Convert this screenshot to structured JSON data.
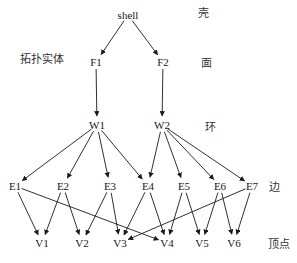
{
  "diagram": {
    "type": "topology-hierarchy",
    "levels": [
      {
        "name": "shell",
        "label": "壳",
        "nodes": [
          {
            "id": "shell",
            "text": "shell",
            "x": 128,
            "y": 15
          }
        ]
      },
      {
        "name": "face",
        "label": "面",
        "nodes": [
          {
            "id": "F1",
            "text": "F1",
            "x": 96,
            "y": 62
          },
          {
            "id": "F2",
            "text": "F2",
            "x": 163,
            "y": 62
          }
        ]
      },
      {
        "name": "loop",
        "label": "环",
        "nodes": [
          {
            "id": "W1",
            "text": "W1",
            "x": 97,
            "y": 125
          },
          {
            "id": "W2",
            "text": "W2",
            "x": 162,
            "y": 125
          }
        ]
      },
      {
        "name": "edge",
        "label": "边",
        "nodes": [
          {
            "id": "E1",
            "text": "E1",
            "x": 15,
            "y": 186
          },
          {
            "id": "E2",
            "text": "E2",
            "x": 63,
            "y": 186
          },
          {
            "id": "E3",
            "text": "E3",
            "x": 110,
            "y": 186
          },
          {
            "id": "E4",
            "text": "E4",
            "x": 148,
            "y": 186
          },
          {
            "id": "E5",
            "text": "E5",
            "x": 184,
            "y": 186
          },
          {
            "id": "E6",
            "text": "E6",
            "x": 220,
            "y": 186
          },
          {
            "id": "E7",
            "text": "E7",
            "x": 252,
            "y": 186
          }
        ]
      },
      {
        "name": "vertex",
        "label": "顶点",
        "nodes": [
          {
            "id": "V1",
            "text": "V1",
            "x": 42,
            "y": 243
          },
          {
            "id": "V2",
            "text": "V2",
            "x": 82,
            "y": 243
          },
          {
            "id": "V3",
            "text": "V3",
            "x": 120,
            "y": 243
          },
          {
            "id": "V4",
            "text": "V4",
            "x": 167,
            "y": 243
          },
          {
            "id": "V5",
            "text": "V5",
            "x": 202,
            "y": 243
          },
          {
            "id": "V6",
            "text": "V6",
            "x": 234,
            "y": 243
          }
        ]
      }
    ],
    "side_labels": {
      "topo_entity": "拓扑实体",
      "shell": "壳",
      "face": "面",
      "loop": "环",
      "edge": "边",
      "vertex": "顶点"
    },
    "edges": [
      [
        "shell",
        "F1"
      ],
      [
        "shell",
        "F2"
      ],
      [
        "F1",
        "W1"
      ],
      [
        "F2",
        "W2"
      ],
      [
        "W1",
        "E1"
      ],
      [
        "W1",
        "E2"
      ],
      [
        "W1",
        "E3"
      ],
      [
        "W1",
        "E4"
      ],
      [
        "W2",
        "E4"
      ],
      [
        "W2",
        "E5"
      ],
      [
        "W2",
        "E6"
      ],
      [
        "W2",
        "E7"
      ],
      [
        "E1",
        "V1"
      ],
      [
        "E1",
        "V4"
      ],
      [
        "E2",
        "V1"
      ],
      [
        "E2",
        "V2"
      ],
      [
        "E3",
        "V2"
      ],
      [
        "E3",
        "V3"
      ],
      [
        "E4",
        "V3"
      ],
      [
        "E4",
        "V4"
      ],
      [
        "E5",
        "V4"
      ],
      [
        "E5",
        "V5"
      ],
      [
        "E6",
        "V5"
      ],
      [
        "E6",
        "V6"
      ],
      [
        "E7",
        "V3"
      ],
      [
        "E7",
        "V6"
      ]
    ],
    "colors": {
      "line": "#1a1a1a",
      "text": "#1a1a1a"
    }
  }
}
